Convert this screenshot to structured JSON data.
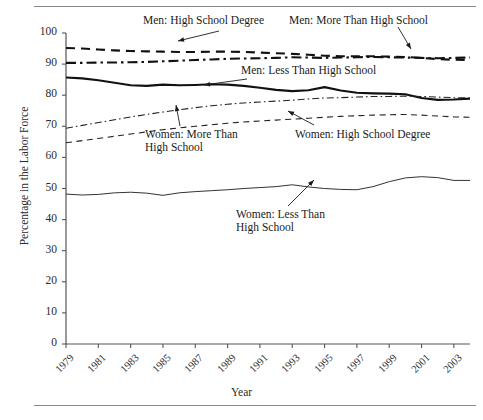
{
  "figure": {
    "rules": [
      "top-rule",
      "bottom-rule"
    ]
  },
  "chart_data": {
    "type": "line",
    "title": "",
    "xlabel": "Year",
    "ylabel": "Percentage in the Labor Force",
    "xlim": [
      1979,
      2004
    ],
    "ylim": [
      0,
      100
    ],
    "grid": false,
    "legend": "inline-annotations",
    "ytick_labels": [
      "0",
      "10",
      "20",
      "30",
      "40",
      "50",
      "60",
      "70",
      "80",
      "90",
      "100"
    ],
    "ytick_values": [
      0,
      10,
      20,
      30,
      40,
      50,
      60,
      70,
      80,
      90,
      100
    ],
    "xtick_labels": [
      "1979",
      "1981",
      "1983",
      "1985",
      "1987",
      "1989",
      "1991",
      "1993",
      "1995",
      "1997",
      "1999",
      "2001",
      "2003"
    ],
    "xtick_values": [
      1979,
      1981,
      1983,
      1985,
      1987,
      1989,
      1991,
      1993,
      1995,
      1997,
      1999,
      2001,
      2003
    ],
    "x": [
      1979,
      1980,
      1981,
      1982,
      1983,
      1984,
      1985,
      1986,
      1987,
      1988,
      1989,
      1990,
      1991,
      1992,
      1993,
      1994,
      1995,
      1996,
      1997,
      1998,
      1999,
      2000,
      2001,
      2002,
      2003,
      2004
    ],
    "series": [
      {
        "name": "Men: High School Degree",
        "style": "dashed",
        "width": 2.1,
        "color": "#111111",
        "values": [
          95.2,
          95.0,
          94.7,
          94.4,
          94.2,
          94.1,
          94.0,
          93.9,
          93.9,
          94.0,
          94.0,
          93.9,
          93.7,
          93.5,
          93.3,
          93.0,
          92.7,
          92.5,
          92.5,
          92.5,
          92.4,
          92.3,
          92.0,
          91.6,
          91.4,
          91.3
        ]
      },
      {
        "name": "Men: More Than High School",
        "style": "dash-dot",
        "width": 2.1,
        "color": "#111111",
        "values": [
          90.4,
          90.4,
          90.5,
          90.5,
          90.6,
          90.7,
          90.9,
          91.1,
          91.3,
          91.5,
          91.7,
          91.8,
          91.9,
          92.0,
          92.2,
          92.1,
          92.0,
          92.1,
          92.2,
          92.3,
          92.2,
          92.1,
          92.0,
          91.9,
          92.0,
          92.1
        ]
      },
      {
        "name": "Men: Less Than High School",
        "style": "solid",
        "width": 2.1,
        "color": "#111111",
        "values": [
          85.7,
          85.4,
          84.8,
          84.0,
          83.2,
          83.0,
          83.4,
          83.2,
          83.3,
          83.5,
          83.4,
          83.0,
          82.4,
          81.7,
          81.3,
          81.6,
          82.6,
          81.5,
          80.8,
          80.6,
          80.5,
          80.3,
          79.1,
          78.5,
          78.6,
          78.9
        ]
      },
      {
        "name": "Women: More Than High School",
        "style": "dash-dot",
        "width": 1.1,
        "color": "#222222",
        "values": [
          69.4,
          70.3,
          71.2,
          72.1,
          73.0,
          73.8,
          74.6,
          75.3,
          76.0,
          76.6,
          77.1,
          77.5,
          77.8,
          78.1,
          78.4,
          78.8,
          79.1,
          79.2,
          79.4,
          79.6,
          79.6,
          79.7,
          79.6,
          79.4,
          79.2,
          79.1
        ]
      },
      {
        "name": "Women: High School Degree",
        "style": "dashed",
        "width": 1.1,
        "color": "#222222",
        "values": [
          64.7,
          65.4,
          66.1,
          66.8,
          67.5,
          68.2,
          68.9,
          69.5,
          70.0,
          70.5,
          71.0,
          71.4,
          71.7,
          72.0,
          72.3,
          72.6,
          72.9,
          73.2,
          73.4,
          73.6,
          73.7,
          73.8,
          73.6,
          73.3,
          73.0,
          72.9
        ]
      },
      {
        "name": "Women: Less Than High School",
        "style": "solid",
        "width": 1.0,
        "color": "#333333",
        "values": [
          48.2,
          47.9,
          48.1,
          48.6,
          48.8,
          48.5,
          47.8,
          48.6,
          49.0,
          49.3,
          49.6,
          50.0,
          50.3,
          50.6,
          51.2,
          50.5,
          50.0,
          49.7,
          49.6,
          50.6,
          52.2,
          53.4,
          53.8,
          53.5,
          52.6,
          52.6
        ]
      }
    ],
    "annotations": [
      {
        "id": "ann-men-hs",
        "text": "Men: High School Degree",
        "x": 143,
        "y": 14,
        "arrow": {
          "x1": 219,
          "y1": 31,
          "x2": 178,
          "y2": 41
        }
      },
      {
        "id": "ann-men-more",
        "text": "Men: More Than High School",
        "x": 289,
        "y": 14,
        "arrow": {
          "x1": 398,
          "y1": 27,
          "x2": 411,
          "y2": 49
        }
      },
      {
        "id": "ann-men-less",
        "text": "Men: Less Than High School",
        "x": 241,
        "y": 64,
        "arrow": {
          "x1": 247,
          "y1": 79,
          "x2": 204,
          "y2": 85
        }
      },
      {
        "id": "ann-women-more",
        "text": "Women: More Than High School",
        "x": 145,
        "y": 128,
        "arrow": {
          "x1": 180,
          "y1": 126,
          "x2": 176,
          "y2": 105
        }
      },
      {
        "id": "ann-women-hs",
        "text": "Women: High School Degree",
        "x": 295,
        "y": 128,
        "arrow": {
          "x1": 314,
          "y1": 125,
          "x2": 288,
          "y2": 111
        }
      },
      {
        "id": "ann-women-less",
        "text": "Women: Less Than High School",
        "x": 236,
        "y": 208,
        "arrow": {
          "x1": 288,
          "y1": 206,
          "x2": 314,
          "y2": 180
        }
      }
    ]
  }
}
